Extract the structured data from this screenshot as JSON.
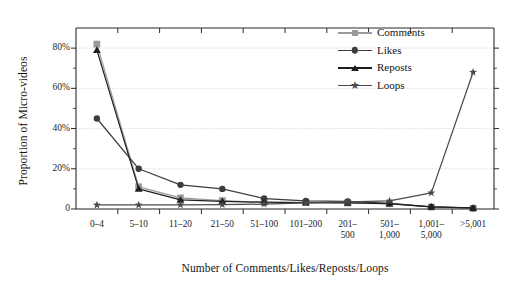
{
  "chart_data": {
    "type": "line",
    "title": "",
    "subtitle": "",
    "xlabel": "Number of Comments/Likes/Reposts/Loops",
    "ylabel": "Proportion of Micro-videos",
    "categories": [
      "0–4",
      "5–10",
      "11–20",
      "21–50",
      "51–100",
      "101–200",
      "201–\n500",
      "501–\n1,000",
      "1,001–\n5,000",
      ">5,001"
    ],
    "category_lines": [
      [
        "0–4"
      ],
      [
        "5–10"
      ],
      [
        "11–20"
      ],
      [
        "21–50"
      ],
      [
        "51–100"
      ],
      [
        "101–200"
      ],
      [
        "201–",
        "500"
      ],
      [
        "501–",
        "1,000"
      ],
      [
        "1,001–",
        "5,000"
      ],
      [
        ">5,001"
      ]
    ],
    "ylim": [
      0,
      90
    ],
    "ytick_values": [
      0,
      20,
      40,
      60,
      80
    ],
    "ytick_labels": [
      "0",
      "20%",
      "40%",
      "60%",
      "80%"
    ],
    "yminor_values": [
      10,
      30,
      50,
      70
    ],
    "grid": "horizontal-dotted",
    "legend_position": "top-right",
    "series": [
      {
        "name": "Comments",
        "marker": "square",
        "color": "#9a9a9a",
        "values": [
          82,
          11,
          5.5,
          4.2,
          3.3,
          3.2,
          3.0,
          2.6,
          1.0,
          0.4
        ]
      },
      {
        "name": "Likes",
        "marker": "circle",
        "color": "#3d3d3d",
        "values": [
          45,
          20,
          12,
          10,
          5.2,
          4.0,
          3.8,
          2.8,
          1.0,
          0.4
        ]
      },
      {
        "name": "Reposts",
        "marker": "triangle",
        "color": "#1f1f1f",
        "values": [
          79,
          10,
          4.5,
          3.8,
          3.4,
          3.2,
          3.1,
          2.7,
          1.1,
          0.5
        ]
      },
      {
        "name": "Loops",
        "marker": "star",
        "color": "#4a4a4a",
        "values": [
          2.0,
          2.0,
          2.1,
          2.2,
          2.4,
          3.0,
          3.5,
          4.0,
          8.0,
          68.0
        ]
      }
    ]
  },
  "legend": {
    "items": [
      {
        "label": "Comments"
      },
      {
        "label": "Likes"
      },
      {
        "label": "Reposts"
      },
      {
        "label": "Loops"
      }
    ]
  }
}
